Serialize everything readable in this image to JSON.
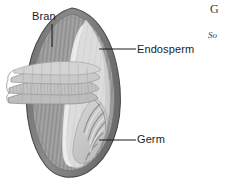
{
  "figure": {
    "name": "grain-kernel-cross-section",
    "style": "grayscale line illustration"
  },
  "labels": [
    {
      "id": "bran",
      "text": "Bran",
      "leader": "vertical line descending from label to outer bran layer"
    },
    {
      "id": "endosperm",
      "text": "Endosperm",
      "leader": "horizontal line running left to the inner endosperm body"
    },
    {
      "id": "germ",
      "text": "Germ",
      "leader": "horizontal line running left to the embryo at lower right"
    }
  ],
  "margin_text": {
    "line_1": "G",
    "line_2": "So"
  },
  "colors": {
    "outline": "#4a4a4a",
    "bran_outer": "#7f7f7f",
    "bran_inner": "#9e9e9e",
    "bran_flap": "#c4c4c4",
    "endosperm": "#dcdcdc",
    "germ": "#cfcfcf",
    "germ_shade": "#b4b4b4",
    "leader_line": "#1c1c1c",
    "label_text": "#1c1c1c",
    "background": "#ffffff"
  }
}
